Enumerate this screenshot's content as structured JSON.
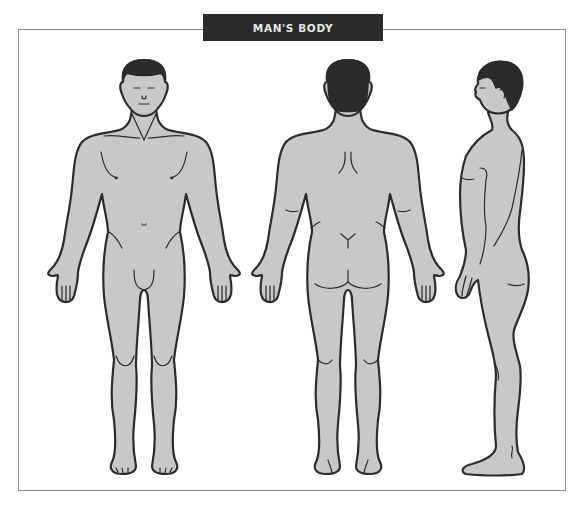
{
  "title": "MAN'S BODY",
  "colors": {
    "title_bg": "#2a2a2a",
    "title_text": "#e8e8e8",
    "body_fill": "#c8c8c8",
    "outline": "#2b2b2b",
    "frame": "#8a8a8a"
  },
  "figures": [
    {
      "view": "front",
      "icon": "man-front-view-icon"
    },
    {
      "view": "back",
      "icon": "man-back-view-icon"
    },
    {
      "view": "side",
      "icon": "man-side-view-icon"
    }
  ]
}
